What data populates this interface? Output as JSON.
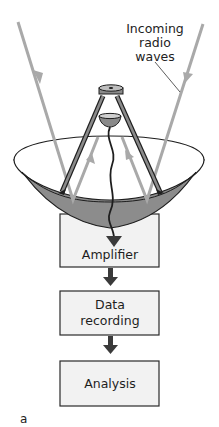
{
  "figure": {
    "annotation": {
      "line1": "Incoming",
      "line2": "radio",
      "line3": "waves"
    },
    "flow_steps": [
      {
        "label_lines": [
          "Amplifier"
        ]
      },
      {
        "label_lines": [
          "Data",
          "recording"
        ]
      },
      {
        "label_lines": [
          "Analysis"
        ]
      }
    ],
    "panel_label": "a",
    "colors": {
      "wave": "#a9a9a9",
      "dish_interior": "#8a8a8a",
      "box_fill": "#f2f2f2",
      "arrow": "#3a3a3a"
    }
  }
}
